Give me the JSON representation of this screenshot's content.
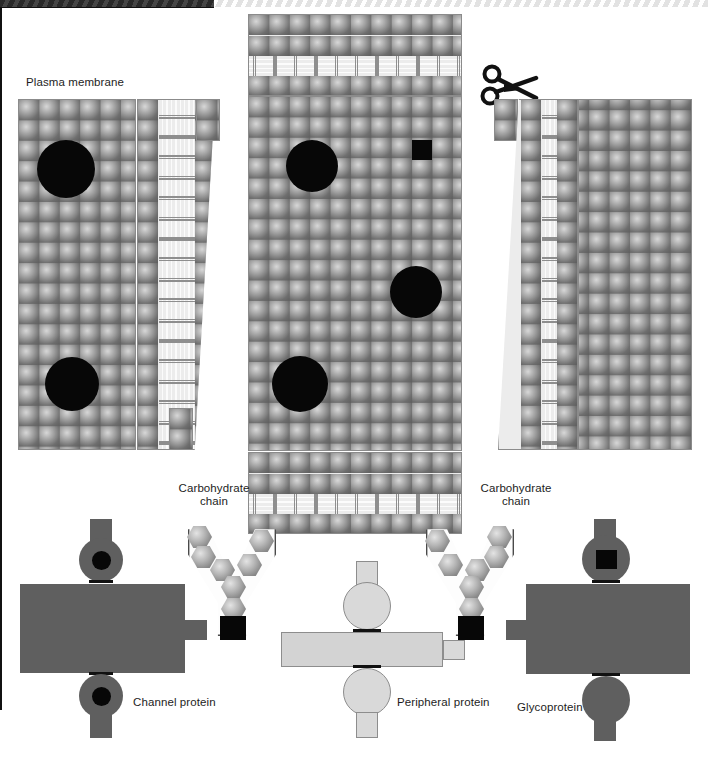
{
  "figure": {
    "type": "paper-model-diagram",
    "background_color": "#ffffff",
    "width": 708,
    "height": 761
  },
  "labels": {
    "plasma_membrane": "Plasma membrane",
    "carbohydrate_chain_left": "Carbohydrate\nchain",
    "carbohydrate_chain_right": "Carbohydrate\nchain",
    "channel_protein": "Channel protein",
    "peripheral_protein": "Peripheral protein",
    "glycoprotein": "Glycoprotein"
  },
  "icons": {
    "scissors": "scissors-icon",
    "cut_hint": "cut-along-line"
  },
  "colors": {
    "phospholipid_head": "#9b9b9b",
    "phospholipid_tail": "#8e8e8e",
    "membrane_fill": "#ececec",
    "hole_black": "#070707",
    "protein_dark": "#5f5f5f",
    "protein_light": "#d3d3d3",
    "outline_gray": "#8b8b8b",
    "cut_line_black": "#111111",
    "page_background": "#ffffff"
  },
  "panels": [
    {
      "id": "left-sheet",
      "name": "left membrane sheet",
      "view": "top-down phospholipid heads",
      "holes": [
        "protein-hole-circle",
        "protein-hole-circle"
      ]
    },
    {
      "id": "left-hinge",
      "name": "left bilayer cross-section strip",
      "view": "cross-section bilayer"
    },
    {
      "id": "center-sheet",
      "name": "center membrane sheet",
      "view": "top-down phospholipid heads with cross-section bands",
      "holes": [
        "protein-hole-circle",
        "protein-hole-circle",
        "protein-hole-circle",
        "protein-hole-square"
      ]
    },
    {
      "id": "right-hinge",
      "name": "right bilayer cross-section strip",
      "view": "cross-section bilayer"
    },
    {
      "id": "right-sheet",
      "name": "right membrane sheet",
      "view": "top-down phospholipid heads"
    }
  ],
  "pieces": [
    {
      "id": "channel-protein",
      "label": "Channel protein",
      "shade": "dark",
      "features": [
        "top circle with black pore",
        "bottom circle with black pore",
        "side tab",
        "top tab",
        "bottom tab"
      ]
    },
    {
      "id": "peripheral-protein",
      "label": "Peripheral protein",
      "shade": "light",
      "features": [
        "top circle",
        "bottom circle",
        "side tab",
        "top tab",
        "bottom tab"
      ]
    },
    {
      "id": "glycoprotein",
      "label": "Glycoprotein",
      "shade": "dark",
      "features": [
        "top circle with black square",
        "bottom circle",
        "side tab",
        "top tab",
        "bottom tab"
      ]
    },
    {
      "id": "carbohydrate-chain-left",
      "label": "Carbohydrate chain",
      "shade": "light",
      "features": [
        "branched Y of 7 hexagonal sugars",
        "black anchor square"
      ]
    },
    {
      "id": "carbohydrate-chain-right",
      "label": "Carbohydrate chain",
      "shade": "light",
      "features": [
        "branched Y of 7 hexagonal sugars",
        "black anchor square"
      ]
    }
  ]
}
